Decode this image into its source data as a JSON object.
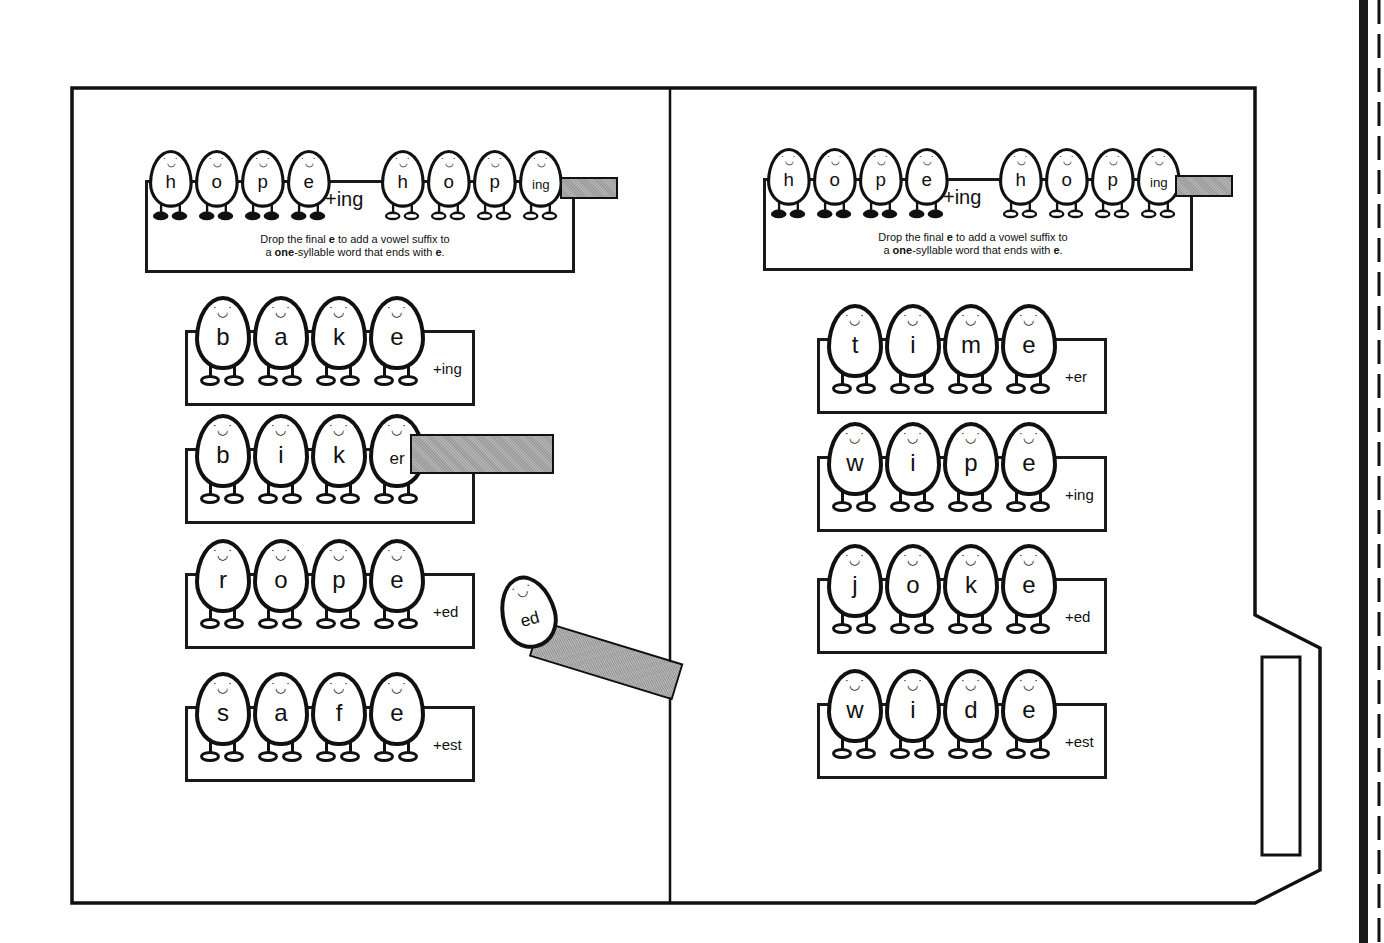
{
  "worksheet": {
    "topic": "Drop the final e before adding a vowel suffix",
    "example_panels": [
      {
        "base_word": [
          "h",
          "o",
          "p",
          "e"
        ],
        "plus_suffix": "+ing",
        "result_word": [
          "h",
          "o",
          "p",
          "ing"
        ],
        "rule_line1_pre": "Drop the final ",
        "rule_line1_bold": "e",
        "rule_line1_post": " to add a vowel suffix to",
        "rule_line2_pre": "a ",
        "rule_line2_bold": "one",
        "rule_line2_mid": "-syllable word that ends with ",
        "rule_line2_bold2": "e",
        "rule_line2_post": "."
      },
      {
        "base_word": [
          "h",
          "o",
          "p",
          "e"
        ],
        "plus_suffix": "+ing",
        "result_word": [
          "h",
          "o",
          "p",
          "ing"
        ],
        "rule_line1_pre": "Drop the final ",
        "rule_line1_bold": "e",
        "rule_line1_post": " to add a vowel suffix to",
        "rule_line2_pre": "a ",
        "rule_line2_bold": "one",
        "rule_line2_mid": "-syllable word that ends with ",
        "rule_line2_bold2": "e",
        "rule_line2_post": "."
      }
    ],
    "left_words": [
      {
        "letters": [
          "b",
          "a",
          "k",
          "e"
        ],
        "suffix": "+ing"
      },
      {
        "letters": [
          "b",
          "i",
          "k",
          "er"
        ],
        "suffix": ""
      },
      {
        "letters": [
          "r",
          "o",
          "p",
          "e"
        ],
        "suffix": "+ed"
      },
      {
        "letters": [
          "s",
          "a",
          "f",
          "e"
        ],
        "suffix": "+est"
      }
    ],
    "right_words": [
      {
        "letters": [
          "t",
          "i",
          "m",
          "e"
        ],
        "suffix": "+er"
      },
      {
        "letters": [
          "w",
          "i",
          "p",
          "e"
        ],
        "suffix": "+ing"
      },
      {
        "letters": [
          "j",
          "o",
          "k",
          "e"
        ],
        "suffix": "+ed"
      },
      {
        "letters": [
          "w",
          "i",
          "d",
          "e"
        ],
        "suffix": "+est"
      }
    ],
    "loose_egg": {
      "label": "ed"
    },
    "face_glyph": "◡̈"
  },
  "colors": {
    "line": "#111111",
    "clip_fill": "#a8a8a8",
    "paper": "#ffffff"
  }
}
